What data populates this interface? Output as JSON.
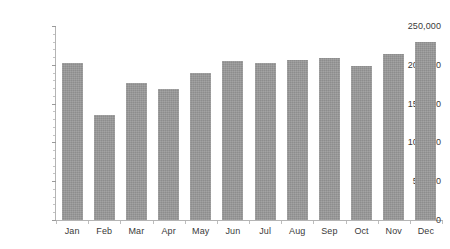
{
  "chart_data": {
    "type": "bar",
    "title": "",
    "subtitle": "",
    "xlabel": "",
    "ylabel": "",
    "categories": [
      "Jan",
      "Feb",
      "Mar",
      "Apr",
      "May",
      "Jun",
      "Jul",
      "Aug",
      "Sep",
      "Oct",
      "Nov",
      "Dec"
    ],
    "values": [
      202000,
      135000,
      177000,
      169000,
      190000,
      205000,
      202000,
      206000,
      209000,
      198000,
      214000,
      230000
    ],
    "ylim": [
      0,
      250000
    ],
    "ytick_values": [
      0,
      50000,
      100000,
      150000,
      200000,
      250000
    ],
    "ytick_labels": [
      "0",
      "50,000",
      "100,000",
      "150,000",
      "200,000",
      "250,000"
    ],
    "grid": false,
    "legend": null,
    "legend_position": "none",
    "series": [
      {
        "name": "",
        "color": "#999999",
        "values": [
          202000,
          135000,
          177000,
          169000,
          190000,
          205000,
          202000,
          206000,
          209000,
          198000,
          214000,
          230000
        ]
      }
    ],
    "colors": {
      "bar": "#999999",
      "axis": "#b4b4b4",
      "tick": "#9a9a9a",
      "text": "#3a3a3a",
      "background": "#ffffff"
    }
  }
}
